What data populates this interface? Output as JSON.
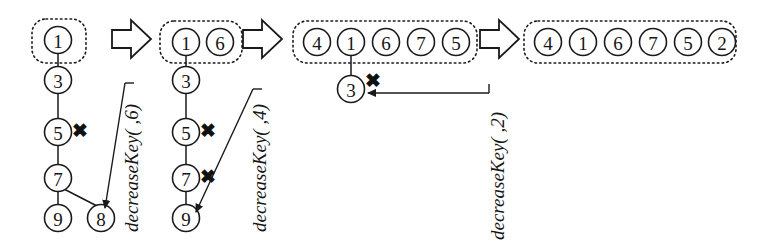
{
  "figure": {
    "stroke_color": "#1a1a1a",
    "background": "#ffffff",
    "marker_x": "✖"
  },
  "stages": [
    {
      "id": "stage-1",
      "roots": [
        "1"
      ],
      "chain": [
        "3",
        "5",
        "7",
        "9"
      ],
      "cut_nodes": [
        "5"
      ],
      "extra_nodes": [
        "8"
      ],
      "box": {
        "x": 32,
        "y": 19,
        "w": 54,
        "h": 44
      }
    },
    {
      "id": "stage-2",
      "roots": [
        "1",
        "6"
      ],
      "chain": [
        "3",
        "5",
        "7",
        "9"
      ],
      "cut_nodes": [
        "5",
        "7"
      ],
      "extra_nodes": [],
      "box": {
        "x": 160,
        "y": 21,
        "w": 82,
        "h": 42
      }
    },
    {
      "id": "stage-3",
      "roots": [
        "4",
        "1",
        "6",
        "7",
        "5"
      ],
      "chain": [
        "3"
      ],
      "cut_nodes": [
        "3"
      ],
      "extra_nodes": [],
      "box": {
        "x": 293,
        "y": 21,
        "w": 184,
        "h": 42
      }
    },
    {
      "id": "stage-4",
      "roots": [
        "4",
        "1",
        "6",
        "7",
        "5",
        "2"
      ],
      "chain": [],
      "cut_nodes": [],
      "extra_nodes": [],
      "box": {
        "x": 524,
        "y": 21,
        "w": 212,
        "h": 42
      }
    }
  ],
  "operations": [
    {
      "id": "op-1",
      "label": "decreaseKey( ,6)",
      "x": 131,
      "y": 232
    },
    {
      "id": "op-2",
      "label": "decreaseKey( ,4)",
      "x": 259,
      "y": 232
    },
    {
      "id": "op-3",
      "label": "decreaseKey( ,2)",
      "x": 497,
      "y": 240
    }
  ],
  "transition_arrows": [
    {
      "id": "transition-arrow-1",
      "x": 112,
      "y": 20
    },
    {
      "id": "transition-arrow-2",
      "x": 243,
      "y": 20
    },
    {
      "id": "transition-arrow-3",
      "x": 480,
      "y": 20
    }
  ]
}
